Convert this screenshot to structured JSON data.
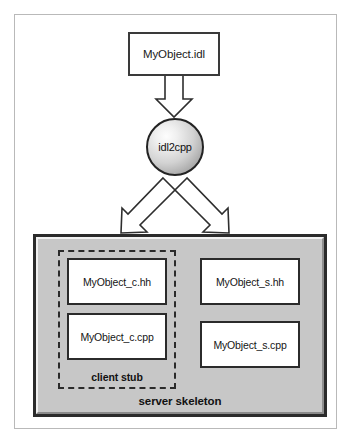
{
  "diagram": {
    "source_file": {
      "label": "MyObject.idl",
      "name": "idl-source-box"
    },
    "compiler": {
      "label": "idl2cpp",
      "name": "idl-compiler-node"
    },
    "arrows": [
      {
        "name": "arrow-idl-to-compiler",
        "direction": "down"
      },
      {
        "name": "arrow-compiler-to-client-stub",
        "direction": "down-left"
      },
      {
        "name": "arrow-compiler-to-server-skeleton",
        "direction": "down-right"
      }
    ],
    "output_panel": {
      "label": "server skeleton",
      "fill_color": "#c7c7c7",
      "border_color": "#2b2b2b"
    },
    "client_stub": {
      "label": "client stub",
      "border_style": "dashed",
      "border_color": "#2a2a2a"
    },
    "generated_files": {
      "client": [
        {
          "label": "MyObject_c.hh"
        },
        {
          "label": "MyObject_c.cpp"
        }
      ],
      "server": [
        {
          "label": "MyObject_s.hh"
        },
        {
          "label": "MyObject_s.cpp"
        }
      ]
    },
    "caption": ""
  }
}
